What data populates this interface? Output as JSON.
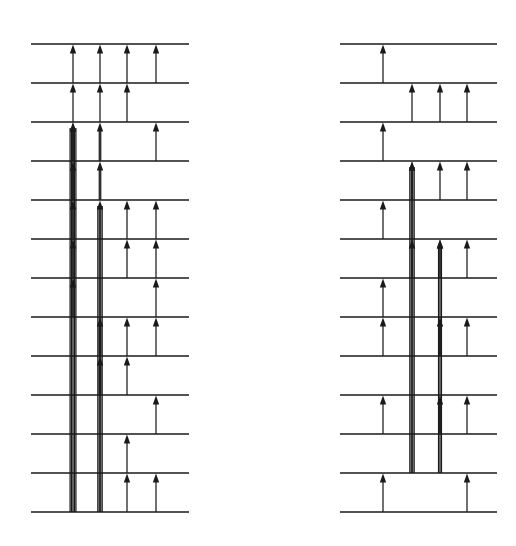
{
  "figure": {
    "background_color": "#ffffff",
    "ink_color": "#1a1a1a",
    "canvas": {
      "width": 516,
      "height": 546
    },
    "panel_count": 2
  },
  "chart_data": {
    "type": "diagram",
    "subtitle": "",
    "xlabel": "",
    "ylabel": "",
    "grid": false,
    "legend_position": "none",
    "level_spacing_px": 39,
    "panels": [
      {
        "name": "left-panel",
        "x_left": 31,
        "x_right": 189,
        "y_top": 44,
        "y_bottom": 512,
        "level_count": 13,
        "levels": [
          {
            "index": 0,
            "y": 44
          },
          {
            "index": 1,
            "y": 83
          },
          {
            "index": 2,
            "y": 122
          },
          {
            "index": 3,
            "y": 161
          },
          {
            "index": 4,
            "y": 200
          },
          {
            "index": 5,
            "y": 239
          },
          {
            "index": 6,
            "y": 278
          },
          {
            "index": 7,
            "y": 317
          },
          {
            "index": 8,
            "y": 356
          },
          {
            "index": 9,
            "y": 395
          },
          {
            "index": 10,
            "y": 434
          },
          {
            "index": 11,
            "y": 473
          },
          {
            "index": 12,
            "y": 512
          }
        ],
        "columns": [
          {
            "index": 0,
            "x": 73
          },
          {
            "index": 1,
            "x": 100
          },
          {
            "index": 2,
            "x": 127
          },
          {
            "index": 3,
            "x": 156
          }
        ],
        "transitions": [
          {
            "column": 0,
            "from": 1,
            "to": 0,
            "weight": 1
          },
          {
            "column": 0,
            "from": 2,
            "to": 1,
            "weight": 1
          },
          {
            "column": 0,
            "from": 3,
            "to": 2,
            "weight": 2
          },
          {
            "column": 0,
            "from": 4,
            "to": 3,
            "weight": 2
          },
          {
            "column": 0,
            "from": 5,
            "to": 4,
            "weight": 3
          },
          {
            "column": 0,
            "from": 6,
            "to": 5,
            "weight": 3
          },
          {
            "column": 0,
            "from": 7,
            "to": 6,
            "weight": 3
          },
          {
            "column": 0,
            "from": 12,
            "to": 2,
            "weight": 5
          },
          {
            "column": 1,
            "from": 1,
            "to": 0,
            "weight": 1
          },
          {
            "column": 1,
            "from": 2,
            "to": 1,
            "weight": 1
          },
          {
            "column": 1,
            "from": 3,
            "to": 2,
            "weight": 2
          },
          {
            "column": 1,
            "from": 4,
            "to": 3,
            "weight": 2
          },
          {
            "column": 1,
            "from": 8,
            "to": 7,
            "weight": 2
          },
          {
            "column": 1,
            "from": 9,
            "to": 8,
            "weight": 2
          },
          {
            "column": 1,
            "from": 12,
            "to": 4,
            "weight": 4
          },
          {
            "column": 2,
            "from": 1,
            "to": 0,
            "weight": 1
          },
          {
            "column": 2,
            "from": 2,
            "to": 1,
            "weight": 1
          },
          {
            "column": 2,
            "from": 5,
            "to": 4,
            "weight": 1
          },
          {
            "column": 2,
            "from": 6,
            "to": 5,
            "weight": 1
          },
          {
            "column": 2,
            "from": 8,
            "to": 7,
            "weight": 1
          },
          {
            "column": 2,
            "from": 9,
            "to": 8,
            "weight": 1
          },
          {
            "column": 2,
            "from": 11,
            "to": 10,
            "weight": 1
          },
          {
            "column": 2,
            "from": 12,
            "to": 11,
            "weight": 1
          },
          {
            "column": 3,
            "from": 1,
            "to": 0,
            "weight": 1
          },
          {
            "column": 3,
            "from": 3,
            "to": 2,
            "weight": 1
          },
          {
            "column": 3,
            "from": 5,
            "to": 4,
            "weight": 1
          },
          {
            "column": 3,
            "from": 6,
            "to": 5,
            "weight": 1
          },
          {
            "column": 3,
            "from": 7,
            "to": 6,
            "weight": 1
          },
          {
            "column": 3,
            "from": 8,
            "to": 7,
            "weight": 1
          },
          {
            "column": 3,
            "from": 10,
            "to": 9,
            "weight": 1
          },
          {
            "column": 3,
            "from": 12,
            "to": 11,
            "weight": 1
          }
        ]
      },
      {
        "name": "right-panel",
        "x_left": 340,
        "x_right": 497,
        "y_top": 44,
        "y_bottom": 512,
        "level_count": 13,
        "levels": [
          {
            "index": 0,
            "y": 44
          },
          {
            "index": 1,
            "y": 83
          },
          {
            "index": 2,
            "y": 122
          },
          {
            "index": 3,
            "y": 161
          },
          {
            "index": 4,
            "y": 200
          },
          {
            "index": 5,
            "y": 239
          },
          {
            "index": 6,
            "y": 278
          },
          {
            "index": 7,
            "y": 317
          },
          {
            "index": 8,
            "y": 356
          },
          {
            "index": 9,
            "y": 395
          },
          {
            "index": 10,
            "y": 434
          },
          {
            "index": 11,
            "y": 473
          },
          {
            "index": 12,
            "y": 512
          }
        ],
        "columns": [
          {
            "index": 0,
            "x": 383
          },
          {
            "index": 1,
            "x": 412
          },
          {
            "index": 2,
            "x": 440
          },
          {
            "index": 3,
            "x": 467
          }
        ],
        "transitions": [
          {
            "column": 0,
            "from": 1,
            "to": 0,
            "weight": 1
          },
          {
            "column": 0,
            "from": 3,
            "to": 2,
            "weight": 1
          },
          {
            "column": 0,
            "from": 5,
            "to": 4,
            "weight": 1
          },
          {
            "column": 0,
            "from": 7,
            "to": 6,
            "weight": 1
          },
          {
            "column": 0,
            "from": 8,
            "to": 7,
            "weight": 1
          },
          {
            "column": 0,
            "from": 10,
            "to": 9,
            "weight": 1
          },
          {
            "column": 0,
            "from": 12,
            "to": 11,
            "weight": 1
          },
          {
            "column": 1,
            "from": 2,
            "to": 1,
            "weight": 1
          },
          {
            "column": 1,
            "from": 4,
            "to": 3,
            "weight": 1
          },
          {
            "column": 1,
            "from": 6,
            "to": 5,
            "weight": 1
          },
          {
            "column": 1,
            "from": 11,
            "to": 3,
            "weight": 4
          },
          {
            "column": 2,
            "from": 2,
            "to": 1,
            "weight": 1
          },
          {
            "column": 2,
            "from": 4,
            "to": 3,
            "weight": 1
          },
          {
            "column": 2,
            "from": 6,
            "to": 5,
            "weight": 1
          },
          {
            "column": 2,
            "from": 8,
            "to": 7,
            "weight": 2
          },
          {
            "column": 2,
            "from": 10,
            "to": 9,
            "weight": 2
          },
          {
            "column": 2,
            "from": 11,
            "to": 5,
            "weight": 3
          },
          {
            "column": 3,
            "from": 2,
            "to": 1,
            "weight": 1
          },
          {
            "column": 3,
            "from": 4,
            "to": 3,
            "weight": 1
          },
          {
            "column": 3,
            "from": 6,
            "to": 5,
            "weight": 1
          },
          {
            "column": 3,
            "from": 8,
            "to": 7,
            "weight": 1
          },
          {
            "column": 3,
            "from": 10,
            "to": 9,
            "weight": 1
          },
          {
            "column": 3,
            "from": 12,
            "to": 11,
            "weight": 1
          }
        ]
      }
    ]
  }
}
